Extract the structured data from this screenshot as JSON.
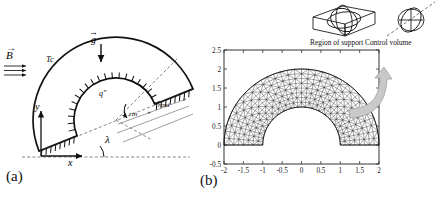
{
  "figure": {
    "panel_a_label": "(a)",
    "panel_b_label": "(b)"
  },
  "panel_a": {
    "name": "schematic-half-annulus",
    "labels": {
      "magnetic_field": "B",
      "gravity": "g",
      "cold_temperature": "Tc",
      "heat_flux": "q″",
      "inner_radius": "rin",
      "outer_radius": "rout",
      "inclination_angle": "λ",
      "axis_x": "x",
      "axis_y": "y"
    },
    "field_lines": 3,
    "geometry": {
      "inner_radius_px": 42,
      "outer_radius_px": 83,
      "center_x_px": 116,
      "center_y_px": 120,
      "tilt_deg": 22
    }
  },
  "panel_b": {
    "name": "finite-element-mesh",
    "chart_title": "",
    "inset": {
      "region_of_support_label": "Region of support",
      "control_volume_label": "Control volume"
    }
  },
  "chart_data": {
    "type": "scatter",
    "title": "",
    "xlabel": "",
    "ylabel": "",
    "xlim": [
      -2,
      2
    ],
    "ylim": [
      -0.5,
      2.5
    ],
    "grid": false,
    "legend": null,
    "xticks": [
      -2,
      -1.5,
      -1,
      -0.5,
      0,
      0.5,
      1,
      1.5,
      2
    ],
    "xtick_labels": [
      "-2",
      "-1.5",
      "-1",
      "-0.5",
      "0",
      "0.5",
      "1",
      "1.5",
      "2"
    ],
    "yticks": [
      -0.5,
      0,
      0.5,
      1,
      1.5,
      2,
      2.5
    ],
    "ytick_labels": [
      "-0.5",
      "0",
      "0.5",
      "1",
      "1.5",
      "2",
      "2.5"
    ],
    "mesh": {
      "description": "structured triangular mesh of a half annulus",
      "inner_radius": 1,
      "outer_radius": 2,
      "center": [
        0,
        0
      ],
      "angle_range_deg": [
        0,
        180
      ],
      "radial_divisions": 8,
      "angular_divisions": 34
    }
  }
}
